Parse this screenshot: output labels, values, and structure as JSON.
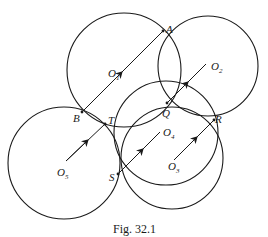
{
  "figure": {
    "caption": "Fig. 32.1",
    "points": {
      "A": "A",
      "B": "B",
      "Q": "Q",
      "R": "R",
      "S": "S",
      "T": "T"
    },
    "centers": [
      {
        "name": "O",
        "sub": "1"
      },
      {
        "name": "O",
        "sub": "2"
      },
      {
        "name": "O",
        "sub": "3"
      },
      {
        "name": "O",
        "sub": "4"
      },
      {
        "name": "O",
        "sub": "5"
      }
    ],
    "stroke_color": "#1a1a1a"
  }
}
